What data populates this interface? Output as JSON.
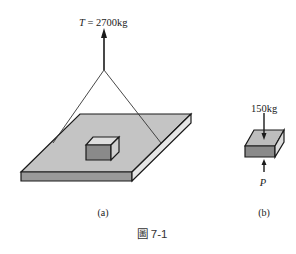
{
  "figure": {
    "caption": "圖 7-1",
    "colors": {
      "plate_top": "#c4c4c4",
      "plate_front": "#9a9a9a",
      "plate_side": "#e6e6e6",
      "box_top": "#bdbdbd",
      "box_front": "#8a8a8a",
      "box_side": "#dcdcdc",
      "outline": "#1a1a1a"
    },
    "panel_a": {
      "label": "(a)",
      "tension_symbol": "T",
      "tension_text": " = 2700kg"
    },
    "panel_b": {
      "label": "(b)",
      "load_text": "150kg",
      "reaction_symbol": "P"
    }
  }
}
